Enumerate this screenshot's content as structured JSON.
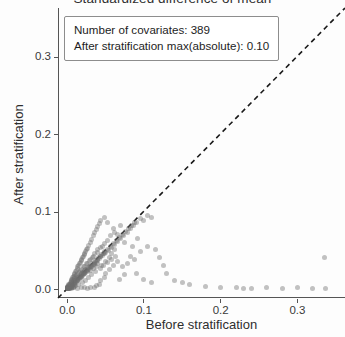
{
  "chart_data": {
    "type": "scatter",
    "title": "Standardized difference of mean",
    "xlabel": "Before stratification",
    "ylabel": "After stratification",
    "xlim": [
      -0.012,
      0.362
    ],
    "ylim": [
      -0.012,
      0.362
    ],
    "xticks": [
      "0.0",
      "0.1",
      "0.2",
      "0.3"
    ],
    "xtick_values": [
      0.0,
      0.1,
      0.2,
      0.3
    ],
    "yticks": [
      "0.0",
      "0.1",
      "0.2",
      "0.3"
    ],
    "ytick_values": [
      0.0,
      0.1,
      0.2,
      0.3
    ],
    "grid": false,
    "legend_position": "top-left",
    "point_color": "#6e6e6e",
    "point_opacity": 0.42,
    "point_size": 5,
    "reference_line": {
      "style": "dashed",
      "color": "#1a1a1a",
      "slope": 1,
      "intercept": 0,
      "label": "y = x"
    },
    "annotations": [
      "Number of covariates: 389",
      "After stratification max(absolute): 0.10"
    ],
    "series": [
      {
        "name": "covariates",
        "points": [
          [
            0.0,
            0.0
          ],
          [
            0.001,
            0.001
          ],
          [
            0.002,
            0.0
          ],
          [
            0.001,
            0.003
          ],
          [
            0.003,
            0.002
          ],
          [
            0.002,
            0.004
          ],
          [
            0.004,
            0.001
          ],
          [
            0.0,
            0.002
          ],
          [
            0.005,
            0.004
          ],
          [
            0.003,
            0.006
          ],
          [
            0.006,
            0.003
          ],
          [
            0.002,
            0.001
          ],
          [
            0.007,
            0.006
          ],
          [
            0.004,
            0.008
          ],
          [
            0.008,
            0.005
          ],
          [
            0.001,
            0.0
          ],
          [
            0.009,
            0.008
          ],
          [
            0.005,
            0.01
          ],
          [
            0.01,
            0.007
          ],
          [
            0.003,
            0.0
          ],
          [
            0.011,
            0.01
          ],
          [
            0.006,
            0.012
          ],
          [
            0.012,
            0.009
          ],
          [
            0.002,
            0.005
          ],
          [
            0.013,
            0.012
          ],
          [
            0.007,
            0.014
          ],
          [
            0.014,
            0.011
          ],
          [
            0.004,
            0.003
          ],
          [
            0.015,
            0.014
          ],
          [
            0.008,
            0.016
          ],
          [
            0.016,
            0.013
          ],
          [
            0.005,
            0.002
          ],
          [
            0.017,
            0.016
          ],
          [
            0.009,
            0.018
          ],
          [
            0.018,
            0.015
          ],
          [
            0.006,
            0.007
          ],
          [
            0.019,
            0.018
          ],
          [
            0.01,
            0.02
          ],
          [
            0.02,
            0.017
          ],
          [
            0.007,
            0.004
          ],
          [
            0.021,
            0.02
          ],
          [
            0.011,
            0.022
          ],
          [
            0.022,
            0.019
          ],
          [
            0.008,
            0.009
          ],
          [
            0.023,
            0.022
          ],
          [
            0.012,
            0.024
          ],
          [
            0.024,
            0.021
          ],
          [
            0.009,
            0.006
          ],
          [
            0.025,
            0.024
          ],
          [
            0.013,
            0.026
          ],
          [
            0.026,
            0.023
          ],
          [
            0.01,
            0.011
          ],
          [
            0.027,
            0.026
          ],
          [
            0.014,
            0.028
          ],
          [
            0.028,
            0.025
          ],
          [
            0.011,
            0.008
          ],
          [
            0.029,
            0.028
          ],
          [
            0.015,
            0.03
          ],
          [
            0.03,
            0.027
          ],
          [
            0.012,
            0.013
          ],
          [
            0.031,
            0.03
          ],
          [
            0.016,
            0.032
          ],
          [
            0.032,
            0.029
          ],
          [
            0.013,
            0.01
          ],
          [
            0.033,
            0.032
          ],
          [
            0.017,
            0.034
          ],
          [
            0.034,
            0.031
          ],
          [
            0.014,
            0.015
          ],
          [
            0.035,
            0.034
          ],
          [
            0.018,
            0.036
          ],
          [
            0.036,
            0.033
          ],
          [
            0.015,
            0.012
          ],
          [
            0.037,
            0.036
          ],
          [
            0.019,
            0.038
          ],
          [
            0.038,
            0.035
          ],
          [
            0.016,
            0.017
          ],
          [
            0.039,
            0.038
          ],
          [
            0.02,
            0.04
          ],
          [
            0.04,
            0.037
          ],
          [
            0.017,
            0.014
          ],
          [
            0.041,
            0.04
          ],
          [
            0.021,
            0.042
          ],
          [
            0.042,
            0.039
          ],
          [
            0.018,
            0.019
          ],
          [
            0.043,
            0.042
          ],
          [
            0.022,
            0.044
          ],
          [
            0.044,
            0.041
          ],
          [
            0.019,
            0.016
          ],
          [
            0.045,
            0.044
          ],
          [
            0.023,
            0.046
          ],
          [
            0.046,
            0.043
          ],
          [
            0.02,
            0.021
          ],
          [
            0.047,
            0.046
          ],
          [
            0.024,
            0.048
          ],
          [
            0.048,
            0.045
          ],
          [
            0.021,
            0.018
          ],
          [
            0.049,
            0.048
          ],
          [
            0.025,
            0.05
          ],
          [
            0.05,
            0.047
          ],
          [
            0.022,
            0.023
          ],
          [
            0.052,
            0.05
          ],
          [
            0.026,
            0.052
          ],
          [
            0.054,
            0.049
          ],
          [
            0.023,
            0.02
          ],
          [
            0.056,
            0.054
          ],
          [
            0.028,
            0.056
          ],
          [
            0.058,
            0.053
          ],
          [
            0.024,
            0.025
          ],
          [
            0.06,
            0.058
          ],
          [
            0.03,
            0.06
          ],
          [
            0.062,
            0.057
          ],
          [
            0.026,
            0.022
          ],
          [
            0.064,
            0.062
          ],
          [
            0.032,
            0.064
          ],
          [
            0.066,
            0.061
          ],
          [
            0.028,
            0.027
          ],
          [
            0.068,
            0.066
          ],
          [
            0.034,
            0.068
          ],
          [
            0.07,
            0.065
          ],
          [
            0.03,
            0.024
          ],
          [
            0.072,
            0.07
          ],
          [
            0.036,
            0.072
          ],
          [
            0.074,
            0.069
          ],
          [
            0.032,
            0.029
          ],
          [
            0.076,
            0.074
          ],
          [
            0.038,
            0.076
          ],
          [
            0.078,
            0.073
          ],
          [
            0.034,
            0.026
          ],
          [
            0.08,
            0.078
          ],
          [
            0.04,
            0.08
          ],
          [
            0.082,
            0.077
          ],
          [
            0.036,
            0.031
          ],
          [
            0.084,
            0.082
          ],
          [
            0.042,
            0.084
          ],
          [
            0.086,
            0.081
          ],
          [
            0.038,
            0.028
          ],
          [
            0.088,
            0.086
          ],
          [
            0.044,
            0.088
          ],
          [
            0.09,
            0.085
          ],
          [
            0.04,
            0.033
          ],
          [
            0.095,
            0.09
          ],
          [
            0.048,
            0.092
          ],
          [
            0.1,
            0.088
          ],
          [
            0.045,
            0.03
          ],
          [
            0.105,
            0.095
          ],
          [
            0.052,
            0.085
          ],
          [
            0.11,
            0.092
          ],
          [
            0.05,
            0.035
          ],
          [
            0.06,
            0.078
          ],
          [
            0.065,
            0.07
          ],
          [
            0.07,
            0.082
          ],
          [
            0.055,
            0.04
          ],
          [
            0.075,
            0.06
          ],
          [
            0.085,
            0.055
          ],
          [
            0.092,
            0.065
          ],
          [
            0.058,
            0.045
          ],
          [
            0.115,
            0.05
          ],
          [
            0.12,
            0.04
          ],
          [
            0.125,
            0.03
          ],
          [
            0.062,
            0.05
          ],
          [
            0.13,
            0.02
          ],
          [
            0.14,
            0.01
          ],
          [
            0.15,
            0.008
          ],
          [
            0.16,
            0.005
          ],
          [
            0.18,
            0.003
          ],
          [
            0.2,
            0.002
          ],
          [
            0.22,
            0.001
          ],
          [
            0.24,
            0.0
          ],
          [
            0.26,
            0.001
          ],
          [
            0.28,
            0.0
          ],
          [
            0.3,
            0.001
          ],
          [
            0.32,
            0.0
          ],
          [
            0.336,
            0.0
          ],
          [
            0.335,
            0.04
          ],
          [
            0.23,
            0.0
          ],
          [
            0.09,
            0.02
          ],
          [
            0.1,
            0.012
          ],
          [
            0.11,
            0.008
          ],
          [
            0.075,
            0.018
          ],
          [
            0.068,
            0.012
          ],
          [
            0.105,
            0.055
          ],
          [
            0.095,
            0.048
          ],
          [
            0.088,
            0.038
          ],
          [
            0.078,
            0.032
          ],
          [
            0.082,
            0.042
          ],
          [
            0.072,
            0.028
          ],
          [
            0.066,
            0.035
          ],
          [
            0.06,
            0.03
          ],
          [
            0.055,
            0.025
          ],
          [
            0.05,
            0.02
          ],
          [
            0.048,
            0.015
          ],
          [
            0.044,
            0.01
          ],
          [
            0.042,
            0.006
          ],
          [
            0.038,
            0.004
          ],
          [
            0.035,
            0.002
          ],
          [
            0.03,
            0.001
          ],
          [
            0.026,
            0.0
          ],
          [
            0.022,
            0.002
          ],
          [
            0.018,
            0.001
          ],
          [
            0.014,
            0.0
          ],
          [
            0.01,
            0.003
          ],
          [
            0.008,
            0.001
          ],
          [
            0.006,
            0.0
          ],
          [
            0.004,
            0.002
          ],
          [
            0.002,
            0.0
          ],
          [
            0.001,
            0.001
          ],
          [
            0.0,
            0.001
          ],
          [
            0.003,
            0.0
          ],
          [
            0.046,
            0.055
          ],
          [
            0.04,
            0.05
          ],
          [
            0.036,
            0.045
          ],
          [
            0.033,
            0.04
          ],
          [
            0.029,
            0.036
          ],
          [
            0.025,
            0.032
          ],
          [
            0.021,
            0.028
          ],
          [
            0.017,
            0.024
          ],
          [
            0.013,
            0.02
          ],
          [
            0.009,
            0.016
          ],
          [
            0.007,
            0.012
          ],
          [
            0.005,
            0.008
          ],
          [
            0.053,
            0.062
          ],
          [
            0.057,
            0.068
          ],
          [
            0.061,
            0.073
          ],
          [
            0.049,
            0.058
          ],
          [
            0.044,
            0.053
          ],
          [
            0.039,
            0.047
          ],
          [
            0.034,
            0.042
          ],
          [
            0.031,
            0.038
          ],
          [
            0.027,
            0.033
          ],
          [
            0.023,
            0.029
          ],
          [
            0.019,
            0.025
          ],
          [
            0.016,
            0.021
          ],
          [
            0.012,
            0.017
          ],
          [
            0.009,
            0.013
          ],
          [
            0.006,
            0.009
          ],
          [
            0.003,
            0.005
          ],
          [
            0.001,
            0.002
          ],
          [
            0.0,
            0.0
          ],
          [
            0.002,
            0.003
          ],
          [
            0.004,
            0.005
          ],
          [
            0.063,
            0.042
          ],
          [
            0.058,
            0.038
          ],
          [
            0.052,
            0.034
          ],
          [
            0.047,
            0.03
          ],
          [
            0.043,
            0.026
          ],
          [
            0.037,
            0.022
          ],
          [
            0.032,
            0.018
          ],
          [
            0.028,
            0.014
          ],
          [
            0.024,
            0.011
          ],
          [
            0.02,
            0.008
          ],
          [
            0.015,
            0.006
          ],
          [
            0.011,
            0.004
          ],
          [
            0.008,
            0.002
          ],
          [
            0.005,
            0.001
          ],
          [
            0.002,
            0.0
          ],
          [
            0.001,
            0.0
          ]
        ]
      }
    ]
  }
}
